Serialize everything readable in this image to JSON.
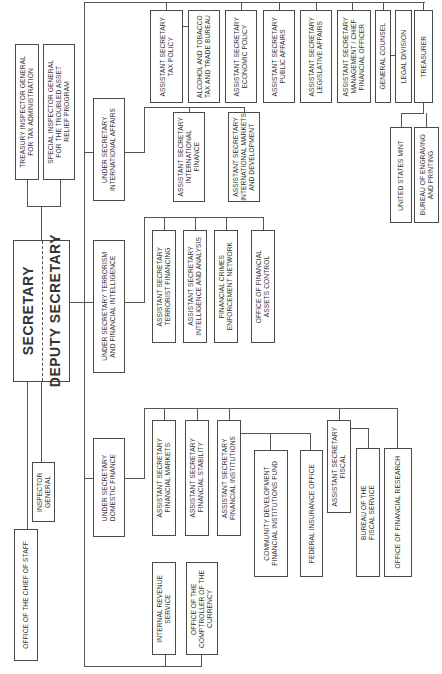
{
  "chart": {
    "orientation": "rotated-90-ccw",
    "colors": {
      "line": "#555555",
      "border": "#4a4a4a",
      "text": "#333333",
      "background": "#ffffff"
    }
  },
  "top": {
    "secretary": "SECRETARY",
    "deputy_secretary": "DEPUTY SECRETARY"
  },
  "staff_units": {
    "tigta": "TREASURY INSPECTOR GENERAL\nFOR TAX ADMINISTRATION",
    "sigtarp": "SPECIAL INSPECTOR GENERAL\nFOR THE TROUBLED ASSET\nRELIEF PROGRAM",
    "inspector_general": "INSPECTOR GENERAL",
    "chief_of_staff": "OFFICE OF THE CHIEF OF STAFF"
  },
  "under_secretaries": {
    "international": "UNDER SECRETARY\nINTERNATIONAL AFFAIRS",
    "terrorism": "UNDER SECRETARY TERRORISM\nAND FINANCIAL INTELLIGENCE",
    "domestic": "UNDER SECRETARY\nDOMESTIC FINANCE"
  },
  "direct_reports": [
    "ASSISTANT SECRETARY\nTAX POLICY",
    "ALCOHOL AND TOBACCO\nTAX AND TRADE BUREAU",
    "ASSISTANT SECRETARY\nECONOMIC POLICY",
    "ASSISTANT SECRETARY\nPUBLIC AFFAIRS",
    "ASSISTANT SECRETARY\nLEGISLATIVE AFFAIRS",
    "ASSISTANT SECRETARY\nMANAGEMENT / CHIEF\nFINANCIAL OFFICER",
    "GENERAL COUNSEL",
    "LEGAL DIVISION",
    "TREASURER"
  ],
  "treasurer_units": [
    "UNITED STATES MINT",
    "BUREAU OF ENGRAVING\nAND PRINTING"
  ],
  "international_units": [
    "ASSISTANT SECRETARY\nINTERNATIONAL\nFINANCE",
    "ASSISTANT SECRETARY\nINTERNATIONAL MARKETS\nAND DEVELOPMENT"
  ],
  "terrorism_units": [
    "ASSISTANT SECRETARY\nTERRORIST FINANCING",
    "ASSISTANT SECRETARY\nINTELLIGENCE AND ANALYSIS",
    "FINANCIAL CRIMES\nENFORCEMENT NETWORK",
    "OFFICE OF FINANCIAL\nASSETS CONTROL"
  ],
  "domestic_units": [
    "ASSISTANT SECRETARY\nFINANCIAL MARKETS",
    "ASSISTANT SECRETARY\nFINANCIAL STABILITY",
    "ASSISTANT SECRETARY\nFINANCIAL INSTITUTIONS"
  ],
  "financial_institutions_units": [
    "COMMUNITY DEVELOPMENT\nFINANCIAL INSTITUTIONS FUND",
    "FEDERAL INSURANCE OFFICE"
  ],
  "fiscal": {
    "asst_sec": "ASSISTANT SECRETARY\nFISCAL",
    "units": [
      "BUREAU OF THE\nFISCAL SERVICE",
      "OFFICE OF FINANCIAL RESEARCH"
    ]
  },
  "deputy_units": [
    "INTERNAL REVENUE\nSERVICE",
    "OFFICE OF THE\nCOMPTROLLER OF THE\nCURRENCY"
  ]
}
